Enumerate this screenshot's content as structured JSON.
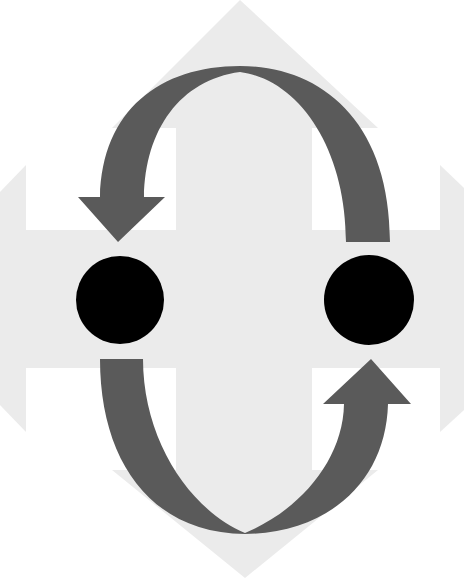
{
  "diagram": {
    "title": "",
    "colors": {
      "background": "#ffffff",
      "cross_arrows": "#ebebeb",
      "cycle_arrows": "#5a5a5a",
      "nodes": "#000000"
    },
    "elements": {
      "cross": {
        "label": "",
        "directions": [
          "up",
          "down",
          "left",
          "right"
        ]
      },
      "cycle_arrow_top": {
        "label": "",
        "from": "right-node",
        "to": "left-node"
      },
      "cycle_arrow_bottom": {
        "label": "",
        "from": "left-node",
        "to": "right-node"
      },
      "left_node": {
        "label": ""
      },
      "right_node": {
        "label": ""
      }
    }
  }
}
